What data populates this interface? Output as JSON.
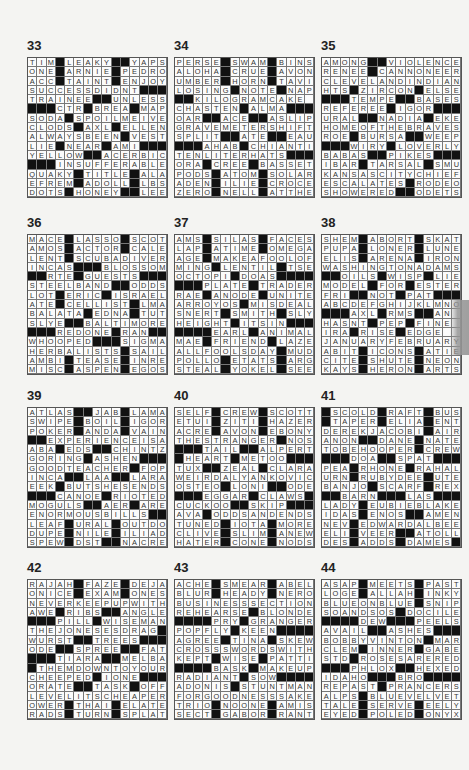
{
  "page": {
    "puzzles": [
      {
        "number": "33",
        "rows": [
          "TIM#LEAKY##YAPS",
          "ONE#ARNIE#PEDRO",
          "ACC#TAINT#ENJOY",
          "SUCCESSDIDNT###",
          "TRAINEE##UNLESS",
          "###CTR#BREA#MAP",
          "SODA#SPOILMEIVE",
          "CLODS#AXL#ELLEN",
          "ALWAYSBEEN#VEST",
          "LIE#NEAR#AMI###",
          "YELLOW##ACERBIC",
          "###INSUFFERABLE",
          "QUAKY#TITLE#ALA",
          "EFREM#ADOLL#LBS",
          "DOTS#HONEY##LEE"
        ]
      },
      {
        "number": "34",
        "rows": [
          "PERSE#SWAM#BINS",
          "ALOHA#CRUE#AVON",
          "UMBER#HORN#TAVI",
          "LOSING#NOTE#NAP",
          "##KILOGRAMCAKE",
          "CHASTEN#ALMA###",
          "OAR##ACE##ASLIP",
          "GRAVEMETERSHIFT",
          "SPLIT##ATE##EAU",
          "###AHAB#CHIANTI",
          "TENLITERHATS###",
          "ORA#CREE#BASSET",
          "PODS#ATOM#SOLAR",
          "ADEN#ILIE#CROCE",
          "ZERO#NELL#ATTHE"
        ]
      },
      {
        "number": "35",
        "rows": [
          "AMONG##VIOLENCE",
          "RENEE#CANNONEER",
          "CLEVELANDINDIAN",
          "HTS#ZIRCON#ELSE",
          "###TEMPE##BASES",
          "REFEREE#IGOR###",
          "URAL##NADIA#EKE",
          "HOMEOFTHEBRAVES",
          "ROE#BURSA##WEEP",
          "###WIRY#LOVERLY",
          "BABAS##PIKES###",
          "IBAR#TARSAL#SMU",
          "KANSASCITYCHIEF",
          "ESCALATES#RODEO",
          "SHOWERED##ODETS"
        ]
      },
      {
        "number": "36",
        "rows": [
          "MACE#LASSO#SCOT",
          "AMOS#ACTOR#CALE",
          "LENT#SCUBADIVER",
          "INCAS###BLOSSOM",
          "##RTE#GUESTS###",
          "STEELBAND##ODDS",
          "LOT#ERIC#ISRAEL",
          "ATE#CELLIST#LMA",
          "BALATA#EDNA#TUT",
          "SLYE##BALTIMORE",
          "###REDONE#RAN##",
          "WHOOPED###SIGMA",
          "HERBALISTS#SAIL",
          "AMBI#TEASE#INRE",
          "MISC#ASPEN#EGOS"
        ]
      },
      {
        "number": "37",
        "rows": [
          "AMS#SILAS#FACES",
          "LAP#ATIME#OMEGA",
          "AGE#MAKEAFOOLOF",
          "MING#LENTIL#TSE",
          "OCTOPI#DOAS####",
          "###PLATE#TRADER",
          "RAE#ANODE#UNITE",
          "ARROYOS#MISDEAL",
          "SNERT#SMITH#SLY",
          "HEIGHT#ITSIN###",
          "####EARL#ANIMAL",
          "MAE#FRIEND#LAZE",
          "ALLFOOLSDAY#MUD",
          "POLLO#ETATS#ARG",
          "STEAL#YOKEL#SEE"
        ]
      },
      {
        "number": "38",
        "rows": [
          "SHEM#ABORT#SKAT",
          "PUPA#LONER#LUNE",
          "ELIS#ARENA#IRON",
          "WASHINGTONADAMS",
          "##OILS#WISP#LIE",
          "MODEL#FOR#ESTER",
          "FRI##NOT#PAT###",
          "ABCDEFGHIJKLMNO",
          "###AXL#RMS##AN ",
          "HASNT#PEP#FINE ",
          "IRA#RISE#EDGE  ",
          "JANUARYFEBRUARY",
          "ABIT#ICONS#ATIE",
          "CITE#SHUTE#NEON",
          "KAYS#HERON#ARTS"
        ]
      },
      {
        "number": "39",
        "rows": [
          "ATLAS##JAB#LAMA",
          "SWIPE#BOIL#IGOR",
          "POKER#ANDA#VAIN",
          "##EXPERIENCEISA",
          "ABA#EDS##CHINTZ",
          "GORING#ASHEN###",
          "GOODTEACHER#FOP",
          "INCA##LAA##LARA",
          "EEK#BUTSHESENDS",
          "###CANOE#RIOTED",
          "MOGULS##AER#ARE",
          "ENORMOUSBILLS##",
          "LEAF#URAL#OUTDO",
          "DUPE#NILE#ILIAD",
          "SPEW#DST##NACRE"
        ]
      },
      {
        "number": "40",
        "rows": [
          "SELF#CREW#SCOTT",
          "ETUI#ZITI#HAZER",
          "ACRE#AVON#EBONY",
          "THESTRANGER#NOS",
          "###TAIL##ALPERT",
          "#HEART#METOO###",
          "TUX##ZEAL#CLARA",
          "WEIRDALYANKOVIC",
          "OSTEO#LONI##ODE",
          "###EGGAR#CLAWS#",
          "CUCKOO##SKIP###",
          "AVA#ODDSANDENDS",
          "TUNED#IOTA#MORE",
          "CLIVE#SLIM#ANEW",
          "HATER#CONE#NODS"
        ]
      },
      {
        "number": "41",
        "rows": [
          "#SCOLD#RAFT#BUS",
          "#TAPER#ELIA#ENT",
          "DEREKJACOBI#AIR",
          "ANON##DANE#NATE",
          "TOBEHOOPER#CREW",
          "###DOA##SPAT###",
          "PEA#RHONE#RAHAL",
          "URN#RUBYDEE#UTE",
          "BANJO#SCARF#REX",
          "##BARN###LAS###",
          "LADY#EUBIEBLAKE",
          "IDAS#ENOS##AMEN",
          "NEV#EDWARDALBEE",
          "ELI#VEER##ATOLL",
          "DES#ADDS#DAMES#"
        ]
      },
      {
        "number": "42",
        "rows": [
          "RAJAH#FAZE#DEJA",
          "ONICE#EXAM#ONES",
          "NEVERKEEPUPWITH",
          "AWE#RIBS##ANGLE",
          "###PILL#WISEMAN",
          "THEJONESESDRAG#",
          "WURST##TREES###",
          "ODE##SPREE##FAT",
          "###TIARA##MELBA",
          "#THEMDOWNTOYOUR",
          "CHEEPED#IONE###",
          "ORATE##TASK#OFF",
          "LEVELITSCHEAPER",
          "OWER#THAI#ELATE",
          "RADS#TURN#SPLAT"
        ]
      },
      {
        "number": "43",
        "rows": [
          "ACHE#SMEAR#ABEL",
          "BLUR#HEADY#NERO",
          "BUSINESSSECTION",
          "REHEARSE#BLONDE",
          "####PRY#GRANGER",
          "POPFLY#KEEN####",
          "AGREE#TINA#SKEW",
          "CROSSSWORDSWITH",
          "KEPT#WISE#PATTI",
          "####BASK#MAKEUP",
          "RADIANT#SOW####",
          "ADONIS#STUNTMAN",
          "FORGOODNESSSAKE",
          "TRIO#NOONE#AMIS",
          "SECT#GABOR#RANT"
        ]
      },
      {
        "number": "44",
        "rows": [
          "ASAP#MEETS#PAST",
          "LOGE#ALLAH#INKY",
          "BLUEONBLUE#SNIP",
          "SOANDSOS#DOCILE",
          "####DEW###PEELS",
          "AVAIL##ASHES###",
          "BOBBYVINTON#MAR",
          "CLEM#INNER#GABE",
          "STD#ROSESARERED",
          "###PHLOX##HEXED",
          "IDAHO###BRO####",
          "REPAST#PRANCERS",
          "ALPS#BLUEVELVET",
          "TALE#SERVE#EELY",
          "EYED#POLED#ONYX"
        ]
      }
    ]
  },
  "colors": {
    "block": "#111111",
    "cell": "#fbfbfb",
    "background": "#f4f4f2",
    "text": "#333333"
  }
}
